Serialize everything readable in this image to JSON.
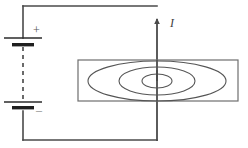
{
  "figure": {
    "background_color": "#ffffff",
    "width": 248,
    "height": 148
  },
  "labels": {
    "positive_terminal": "+",
    "negative_terminal": "–",
    "current": "I"
  },
  "colors": {
    "wire": "#4a4a4a",
    "battery": "#2b2b2b",
    "plane": "#6e6e6e",
    "field_lines": "#555555",
    "dashed": "#3a3a3a"
  },
  "circuit": {
    "loop": {
      "left_x": 23,
      "right_x": 157,
      "top_y": 6,
      "bottom_y": 140
    },
    "battery": {
      "cells": 2,
      "top_cell_y": 38,
      "bottom_cell_y": 106,
      "long_plate_half_width": 19,
      "short_plate_half_width": 11,
      "dashed_between_cells": true
    },
    "current_arrow": {
      "direction": "up",
      "x": 157,
      "tip_y": 22
    }
  },
  "field": {
    "plane": {
      "x": 78,
      "y": 60,
      "width": 160,
      "height": 41
    },
    "center": {
      "x": 157,
      "y": 81
    },
    "ellipses": [
      {
        "rx": 15,
        "ry": 7
      },
      {
        "rx": 38,
        "ry": 14
      },
      {
        "rx": 69,
        "ry": 20
      }
    ]
  }
}
